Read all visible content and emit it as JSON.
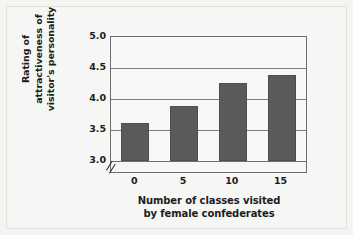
{
  "chart_data": {
    "type": "bar",
    "title": "",
    "subtitle": "",
    "xlabel_lines": [
      "Number of classes visited",
      "by female confederates"
    ],
    "ylabel_lines": [
      "Rating of",
      "attractiveness of",
      "visitor's personality"
    ],
    "categories": [
      "0",
      "5",
      "10",
      "15"
    ],
    "values": [
      3.62,
      3.89,
      4.26,
      4.39
    ],
    "ylim": [
      3.0,
      5.0
    ],
    "axis_break": true,
    "axis_break_symbol": "//",
    "yticks": [
      "3.0",
      "3.5",
      "4.0",
      "4.5",
      "5.0"
    ],
    "ytick_values": [
      3.0,
      3.5,
      4.0,
      4.5,
      5.0
    ],
    "grid": "horizontal",
    "legend": "none",
    "bar_color": "#5a5a5a",
    "plot_background": "#f7f7f5",
    "figure_background": "#f4f4f2",
    "axis_color": "#6e6e6e",
    "text_color": "#1c1c1c"
  }
}
